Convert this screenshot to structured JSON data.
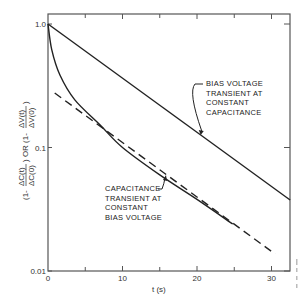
{
  "chart_data": {
    "type": "line",
    "title": "",
    "xlabel": "t (s)",
    "ylabel": "(1 - ΔC(t)/ΔC(0)) OR (1 - ΔV(t)/ΔV(0))",
    "ylabel_parts": {
      "left_prefix": "(1-",
      "left_num": "ΔC(t)",
      "left_den": "ΔC(0)",
      "or": ") OR (1-",
      "right_num": "ΔV(t)",
      "right_den": "ΔV(0)",
      "close": ")"
    },
    "xlim": [
      0,
      32.5
    ],
    "ylim": [
      0.01,
      1.0
    ],
    "yscale": "log",
    "grid": false,
    "x_ticks": [
      0,
      10,
      20,
      30
    ],
    "x_tick_labels": [
      "0",
      "10",
      "20",
      "30"
    ],
    "x_minor_ticks": [
      5,
      15,
      25
    ],
    "y_ticks": [
      1.0,
      0.1,
      0.01
    ],
    "y_tick_labels": [
      "1.0",
      "0.1",
      "0.01"
    ],
    "series": [
      {
        "name": "Bias voltage transient at constant capacitance",
        "style": "solid",
        "x": [
          0,
          32.5
        ],
        "y": [
          1.0,
          0.0376
        ]
      },
      {
        "name": "Capacitance transient at constant bias voltage",
        "style": "solid",
        "x": [
          0,
          0.5,
          1.6,
          3.6,
          7,
          10,
          15,
          20,
          24.8
        ],
        "y": [
          1.0,
          0.62,
          0.386,
          0.243,
          0.152,
          0.1,
          0.06,
          0.038,
          0.024
        ]
      },
      {
        "name": "Exponential asymptote (extrapolation)",
        "style": "dashed",
        "x": [
          0.9,
          30.5
        ],
        "y": [
          0.276,
          0.0137
        ]
      }
    ],
    "annotations": [
      {
        "lines": [
          "BIAS VOLTAGE",
          "TRANSIENT AT",
          "CONSTANT",
          "CAPACITANCE"
        ],
        "points_to": "series-0",
        "at_x": 5,
        "target_t": 20.5
      },
      {
        "lines": [
          "CAPACITANCE",
          "TRANSIENT AT",
          "CONSTANT",
          "BIAS VOLTAGE"
        ],
        "points_to": "series-1",
        "target_t": 16.2
      }
    ]
  }
}
